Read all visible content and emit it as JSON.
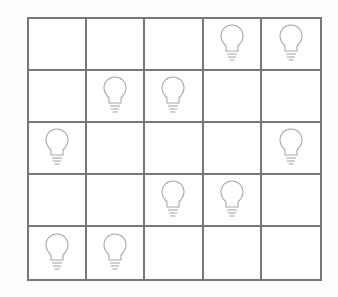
{
  "puzzle": {
    "rows": 5,
    "cols": 5,
    "grid": [
      [
        0,
        0,
        0,
        1,
        1
      ],
      [
        0,
        1,
        1,
        0,
        0
      ],
      [
        1,
        0,
        0,
        0,
        1
      ],
      [
        0,
        0,
        1,
        1,
        0
      ],
      [
        1,
        1,
        0,
        0,
        0
      ]
    ],
    "bulb_icon": "lightbulb-icon",
    "colors": {
      "grid_line": "#777777",
      "bulb_outline": "#a8a8a8",
      "cell_bg": "#ffffff"
    }
  }
}
